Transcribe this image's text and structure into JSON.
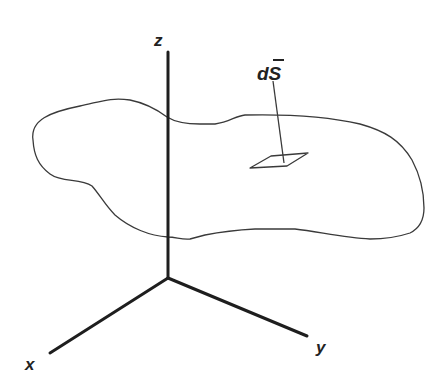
{
  "diagram": {
    "axes": {
      "z_label": "z",
      "x_label": "x",
      "y_label": "y"
    },
    "annotation": {
      "label": "dS̄",
      "label_base": "dS",
      "label_bar": "‾"
    },
    "colors": {
      "axis": "#1e1e1e",
      "outline": "#3a3a3a",
      "background": "#ffffff"
    }
  }
}
